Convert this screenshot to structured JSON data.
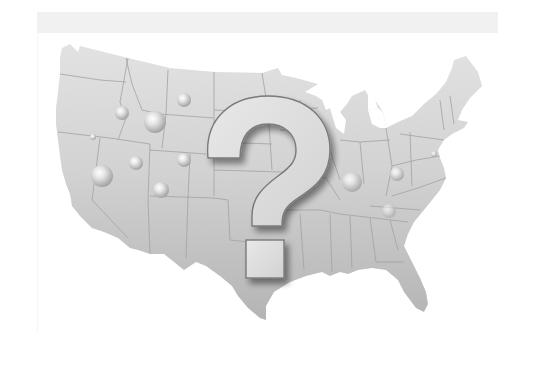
{
  "image": {
    "description": "Grayscale illustration of the contiguous United States map with a large 3D question mark in the center and scattered glossy spheres",
    "alt_text": "US map with question mark"
  },
  "colors": {
    "background": "#ffffff",
    "top_band": "#efefef",
    "map_north": "#e2e2e2",
    "map_south": "#b9b9b9",
    "state_lines": "#9a9a9a",
    "question_face": "#dcdcdc",
    "question_edge": "#7a7a7a",
    "sphere_light": "#ffffff",
    "sphere_dark": "#9c9c9c"
  },
  "symbol": {
    "glyph": "?"
  },
  "spheres": [
    {
      "cx": 184,
      "cy": 100,
      "r": 7
    },
    {
      "cx": 122,
      "cy": 113,
      "r": 7
    },
    {
      "cx": 155,
      "cy": 122,
      "r": 11
    },
    {
      "cx": 93,
      "cy": 137,
      "r": 3
    },
    {
      "cx": 136,
      "cy": 163,
      "r": 7
    },
    {
      "cx": 184,
      "cy": 160,
      "r": 7
    },
    {
      "cx": 102,
      "cy": 176,
      "r": 11
    },
    {
      "cx": 161,
      "cy": 190,
      "r": 8
    },
    {
      "cx": 352,
      "cy": 182,
      "r": 10
    },
    {
      "cx": 397,
      "cy": 174,
      "r": 7
    },
    {
      "cx": 389,
      "cy": 211,
      "r": 7
    },
    {
      "cx": 434,
      "cy": 154,
      "r": 3
    }
  ]
}
